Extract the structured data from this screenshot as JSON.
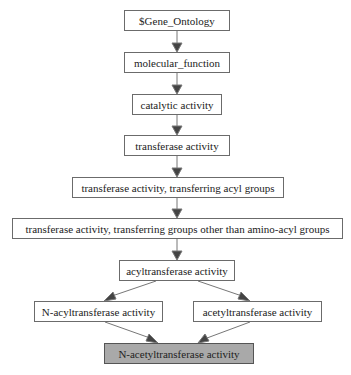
{
  "diagram": {
    "type": "go-hierarchy",
    "nodes": [
      {
        "id": "n0",
        "label": "$Gene_Ontology",
        "x": 124,
        "y": 10,
        "w": 106,
        "h": 21,
        "highlight": false
      },
      {
        "id": "n1",
        "label": "molecular_function",
        "x": 124,
        "y": 52,
        "w": 106,
        "h": 21,
        "highlight": false
      },
      {
        "id": "n2",
        "label": "catalytic activity",
        "x": 132,
        "y": 94,
        "w": 90,
        "h": 21,
        "highlight": false
      },
      {
        "id": "n3",
        "label": "transferase activity",
        "x": 124,
        "y": 135,
        "w": 106,
        "h": 21,
        "highlight": false
      },
      {
        "id": "n4",
        "label": "transferase activity, transferring acyl groups",
        "x": 72,
        "y": 177,
        "w": 212,
        "h": 21,
        "highlight": false
      },
      {
        "id": "n5",
        "label": "transferase activity, transferring groups other than amino-acyl groups",
        "x": 12,
        "y": 218,
        "w": 331,
        "h": 21,
        "highlight": false
      },
      {
        "id": "n6",
        "label": "acyltransferase activity",
        "x": 119,
        "y": 260,
        "w": 116,
        "h": 21,
        "highlight": false
      },
      {
        "id": "n7",
        "label": "N-acyltransferase activity",
        "x": 34,
        "y": 301,
        "w": 129,
        "h": 21,
        "highlight": false
      },
      {
        "id": "n8",
        "label": "acetyltransferase activity",
        "x": 193,
        "y": 301,
        "w": 129,
        "h": 21,
        "highlight": false
      },
      {
        "id": "n9",
        "label": "N-acetyltransferase activity",
        "x": 104,
        "y": 343,
        "w": 150,
        "h": 21,
        "highlight": true
      }
    ],
    "edges": [
      {
        "from": "n0",
        "to": "n1"
      },
      {
        "from": "n1",
        "to": "n2"
      },
      {
        "from": "n2",
        "to": "n3"
      },
      {
        "from": "n3",
        "to": "n4"
      },
      {
        "from": "n4",
        "to": "n5"
      },
      {
        "from": "n5",
        "to": "n6"
      },
      {
        "from": "n6",
        "to": "n7"
      },
      {
        "from": "n6",
        "to": "n8"
      },
      {
        "from": "n7",
        "to": "n9"
      },
      {
        "from": "n8",
        "to": "n9"
      }
    ],
    "colors": {
      "edge": "#666666",
      "arrow": "#444444",
      "highlight_fill": "#a9a9a9",
      "border": "#6b6b6b"
    }
  }
}
